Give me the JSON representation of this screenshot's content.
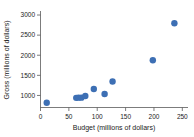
{
  "chart_data": {
    "type": "scatter",
    "title": "",
    "xlabel": "Budget (millions of dollars)",
    "ylabel": "Gross (millions of dollars)",
    "xlim": [
      0,
      260
    ],
    "ylim": [
      700,
      3100
    ],
    "xticks": [
      0,
      50,
      100,
      150,
      200,
      250
    ],
    "xtick_labels": [
      "0",
      "50",
      "100",
      "150",
      "200",
      "250"
    ],
    "yticks": [
      1000,
      1500,
      2000,
      2500,
      3000
    ],
    "ytick_labels": [
      "1000",
      "1500",
      "2000",
      "2500",
      "3000"
    ],
    "grid": false,
    "legend": "none",
    "marker_color": "#3d6fb4",
    "marker_size": 3.2,
    "points": [
      {
        "x": 11,
        "y": 820
      },
      {
        "x": 63,
        "y": 940
      },
      {
        "x": 67,
        "y": 945
      },
      {
        "x": 72,
        "y": 945
      },
      {
        "x": 79,
        "y": 985
      },
      {
        "x": 94,
        "y": 1160
      },
      {
        "x": 113,
        "y": 1035
      },
      {
        "x": 127,
        "y": 1345
      },
      {
        "x": 198,
        "y": 1875
      },
      {
        "x": 236,
        "y": 2795
      }
    ]
  },
  "axes": {
    "x_label": "Budget (millions of dollars)",
    "y_label": "Gross (millions of dollars)"
  }
}
